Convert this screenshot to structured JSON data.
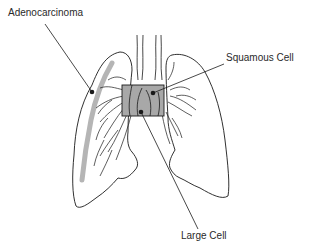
{
  "diagram": {
    "labels": [
      {
        "id": "adenocarcinoma",
        "text": "Adenocarcinoma",
        "x": 8,
        "y": 12
      },
      {
        "id": "squamous",
        "text": "Squamous Cell",
        "x": 226,
        "y": 53
      },
      {
        "id": "large",
        "text": "Large Cell",
        "x": 181,
        "y": 232
      }
    ],
    "colors": {
      "outline": "#1a1a1a",
      "tumor_fill": "#a8a8a8",
      "peripheral_band": "#b5b5b5"
    }
  }
}
